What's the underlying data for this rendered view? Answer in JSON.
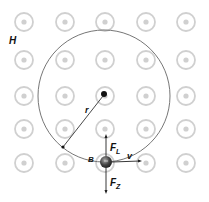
{
  "diagram": {
    "field_label": "H",
    "radius_label": "r",
    "particle_label": "B",
    "force_up_label": "F",
    "force_up_sub": "L",
    "force_down_label": "F",
    "force_down_sub": "Z",
    "velocity_label": "v",
    "field_symbol": "out-of-page-dot-circle",
    "field_grid": {
      "rows": 5,
      "cols": 5
    },
    "colors": {
      "field_symbol": "#d0d0d0",
      "trajectory": "#666666",
      "vectors": "#222222",
      "particle": "#3a3a3a"
    }
  }
}
